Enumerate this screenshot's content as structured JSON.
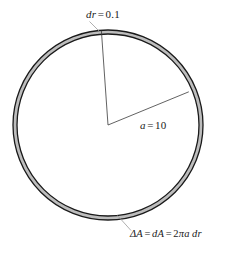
{
  "figure": {
    "type": "geometry-diagram",
    "background_color": "#ffffff",
    "stroke_color": "#1a1a1a",
    "ring_fill_color": "#b9b9b9",
    "leader_color": "#9a9a9a"
  },
  "geometry": {
    "center_x": 108,
    "center_y": 125,
    "outer_radius": 95,
    "inner_radius": 91,
    "radius_line_1": {
      "x1": 108,
      "y1": 125,
      "x2": 101.5,
      "y2": 30.5
    },
    "radius_line_2": {
      "x1": 108,
      "y1": 125,
      "x2": 188.5,
      "y2": 92.0
    },
    "leader_dr": {
      "x1": 98,
      "y1": 31,
      "x2": 88,
      "y2": 21
    },
    "leader_da": {
      "x1": 117,
      "y1": 215,
      "x2": 131,
      "y2": 230
    }
  },
  "labels": {
    "dr": {
      "name": "dr-label",
      "var": "dr",
      "eq": "=",
      "value": "0.1",
      "full": "dr = 0.1"
    },
    "a": {
      "name": "radius-label",
      "var": "a",
      "eq": "=",
      "value": "10",
      "full": "a = 10"
    },
    "area": {
      "name": "area-formula-label",
      "delta_a": "ΔA",
      "eq1": "=",
      "d_a": "dA",
      "eq2": "=",
      "expr_num": "2",
      "expr_pi": "π",
      "expr_a": "a",
      "expr_dr": "dr",
      "full": "ΔA = dA = 2πa dr"
    }
  }
}
